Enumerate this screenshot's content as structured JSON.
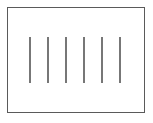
{
  "figure": {
    "canvas": {
      "width": 153,
      "height": 123,
      "background_color": "#ffffff"
    },
    "frame": {
      "name": "rectangle-border",
      "x": 7,
      "y": 7,
      "width": 138,
      "height": 106,
      "border_color": "#5a5a5a",
      "border_width": 1.5,
      "fill_color": "#ffffff"
    },
    "strokes": {
      "count": 6,
      "color": "#777777",
      "line_width": 1.5,
      "top": 37,
      "bottom": 83,
      "length": 46,
      "spacing": 18,
      "items": [
        {
          "index": 1,
          "x": 29,
          "y": 37,
          "length": 46
        },
        {
          "index": 2,
          "x": 47,
          "y": 37,
          "length": 46
        },
        {
          "index": 3,
          "x": 65,
          "y": 37,
          "length": 46
        },
        {
          "index": 4,
          "x": 83,
          "y": 37,
          "length": 46
        },
        {
          "index": 5,
          "x": 101,
          "y": 37,
          "length": 46
        },
        {
          "index": 6,
          "x": 119,
          "y": 37,
          "length": 46
        }
      ]
    }
  }
}
